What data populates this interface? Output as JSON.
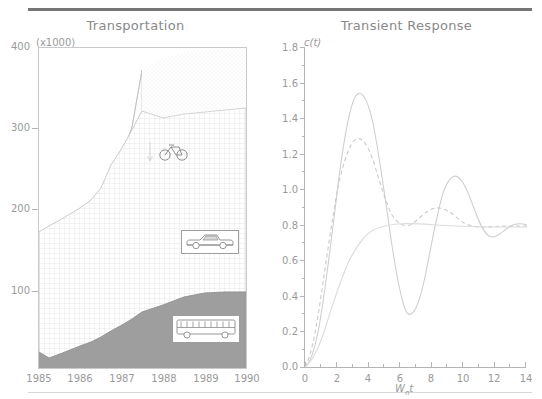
{
  "figure": {
    "panels": 2,
    "background": "#ffffff",
    "rule_color": "#757575",
    "axis_color": "#c9c9c9",
    "text_color": "#9a9a9a"
  },
  "chart_data": [
    {
      "type": "area",
      "title": "Transportation",
      "ylabel": "(x1000)",
      "xlabel": "",
      "xlim": [
        1985,
        1990
      ],
      "ylim": [
        0,
        400
      ],
      "grid": false,
      "legend": "in-plot icons",
      "x_tick_labels": [
        "1985",
        "1986",
        "1987",
        "1988",
        "1989",
        "1990"
      ],
      "y_tick_labels": [
        "400",
        "300",
        "200",
        "100"
      ],
      "y_tick_values": [
        400,
        300,
        200,
        100
      ],
      "stacked": true,
      "annotations": [
        {
          "name": "bicycle-icon",
          "label": "bicycle",
          "series": "Bicycle"
        },
        {
          "name": "car-icon",
          "label": "car",
          "series": "Car"
        },
        {
          "name": "bus-icon",
          "label": "bus",
          "series": "Bus"
        }
      ],
      "series": [
        {
          "name": "Bus",
          "fill": "#9e9e9e",
          "pattern": "solid",
          "x": [
            1985,
            1985.5,
            1986,
            1986.5,
            1987,
            1987.5,
            1988,
            1988.5,
            1989,
            1989.5,
            1990
          ],
          "values": [
            20,
            28,
            37,
            45,
            54,
            62,
            72,
            84,
            91,
            93,
            95
          ]
        },
        {
          "name": "Car",
          "fill": "#efefef",
          "pattern": "cross-hatch",
          "x": [
            1985,
            1985.5,
            1986,
            1986.5,
            1987,
            1987.5,
            1988,
            1988.5,
            1989,
            1989.5,
            1990
          ],
          "values": [
            45,
            55,
            65,
            75,
            88,
            98,
            104,
            112,
            125,
            140,
            185
          ]
        },
        {
          "name": "Bicycle",
          "fill": "#f7f7f7",
          "pattern": "fine-dot",
          "x": [
            1985,
            1985.5,
            1986,
            1986.5,
            1987,
            1987.5,
            1988,
            1988.5,
            1989,
            1989.5,
            1990
          ],
          "values": [
            0,
            0,
            0,
            0,
            0,
            0,
            12,
            30,
            50,
            68,
            92
          ]
        }
      ],
      "cumulative_top": [
        65,
        83,
        102,
        120,
        142,
        160,
        188,
        226,
        266,
        301,
        372
      ]
    },
    {
      "type": "line",
      "title": "Transient Response",
      "ylabel": "c(t)",
      "xlabel": "Wnt",
      "xlabel_display": "W<sub>n</sub>t",
      "xlim": [
        0,
        14
      ],
      "ylim": [
        0.0,
        1.8
      ],
      "grid": false,
      "x_tick_labels": [
        "0",
        "2",
        "4",
        "6",
        "8",
        "10",
        "12",
        "14"
      ],
      "x_tick_values": [
        0,
        2,
        4,
        6,
        8,
        10,
        12,
        14
      ],
      "x_minor_ticks": [
        1,
        3,
        5,
        7,
        9,
        11,
        13
      ],
      "y_tick_labels": [
        "1.8",
        "1.6",
        "1.4",
        "1.2",
        "1.0",
        "0.8",
        "0.6",
        "0.4",
        "0.2",
        "0.0"
      ],
      "y_tick_values": [
        1.8,
        1.6,
        1.4,
        1.2,
        1.0,
        0.8,
        0.6,
        0.4,
        0.2,
        0.0
      ],
      "series": [
        {
          "name": "zeta = 0.1",
          "style": "solid",
          "overshoot_peak": 1.7,
          "peak_at_x": 3.2,
          "trough": 0.47,
          "trough_at_x": 6.5,
          "second_peak": 1.37,
          "second_peak_at_x": 9.6,
          "settles_to": 1.0
        },
        {
          "name": "zeta = 0.3",
          "style": "dashed",
          "overshoot_peak": 1.35,
          "peak_at_x": 3.1,
          "trough": 0.86,
          "trough_at_x": 6.4,
          "second_peak": 1.05,
          "second_peak_at_x": 9.6,
          "settles_to": 1.0
        },
        {
          "name": "zeta = 1.0",
          "style": "solid-flat",
          "overshoot_peak": 1.005,
          "peak_at_x": 4.6,
          "settles_to": 1.0
        }
      ]
    }
  ]
}
